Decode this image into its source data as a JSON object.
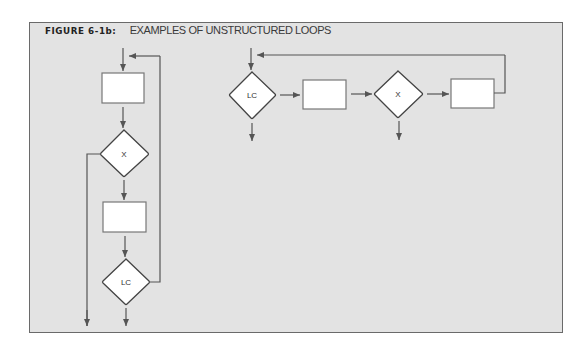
{
  "figure": {
    "label": "FIGURE 6-1b:",
    "caption": "EXAMPLES OF UNSTRUCTURED LOOPS"
  },
  "colors": {
    "background": "#e3e3e3",
    "border": "#6a6a6a",
    "line": "#555555",
    "node_fill": "#ffffff"
  },
  "left_flowchart": {
    "nodes": [
      {
        "type": "process",
        "label": ""
      },
      {
        "type": "decision",
        "label": "X"
      },
      {
        "type": "process",
        "label": ""
      },
      {
        "type": "decision",
        "label": "LC"
      }
    ]
  },
  "right_flowchart": {
    "nodes": [
      {
        "type": "decision",
        "label": "LC"
      },
      {
        "type": "process",
        "label": ""
      },
      {
        "type": "decision",
        "label": "X"
      },
      {
        "type": "process",
        "label": ""
      }
    ]
  }
}
